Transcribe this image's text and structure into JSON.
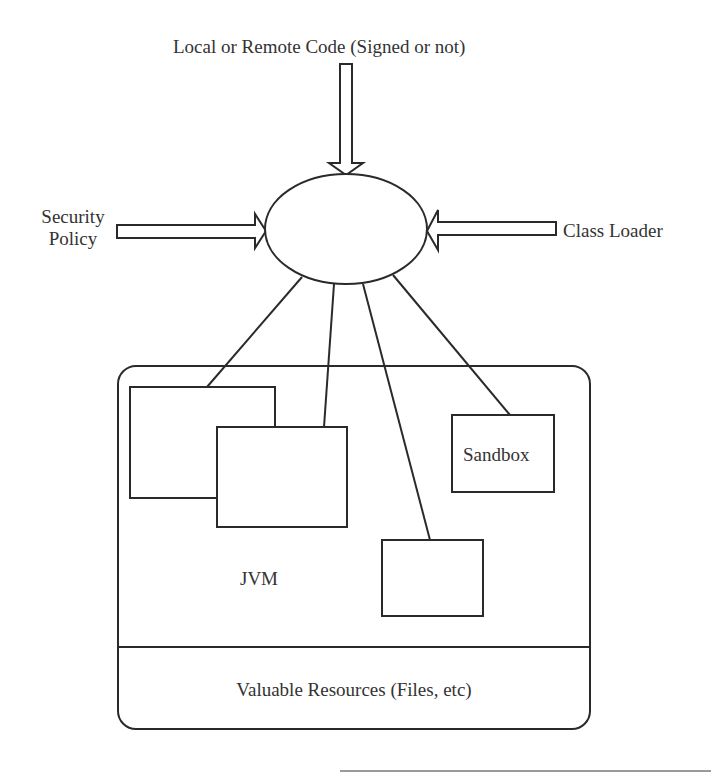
{
  "diagram": {
    "top_input": {
      "label": "Local or Remote Code (Signed or not)"
    },
    "left_input": {
      "label_line1": "Security",
      "label_line2": "Policy"
    },
    "right_input": {
      "label": "Class Loader"
    },
    "central_node": {
      "label": ""
    },
    "container": {
      "jvm_label": "JVM",
      "resources_label": "Valuable Resources (Files, etc)",
      "boxes": [
        {
          "label": ""
        },
        {
          "label": ""
        },
        {
          "label": ""
        },
        {
          "label": "Sandbox"
        }
      ]
    },
    "colors": {
      "stroke": "#2a2a2a",
      "background": "#ffffff",
      "text": "#333333"
    }
  }
}
